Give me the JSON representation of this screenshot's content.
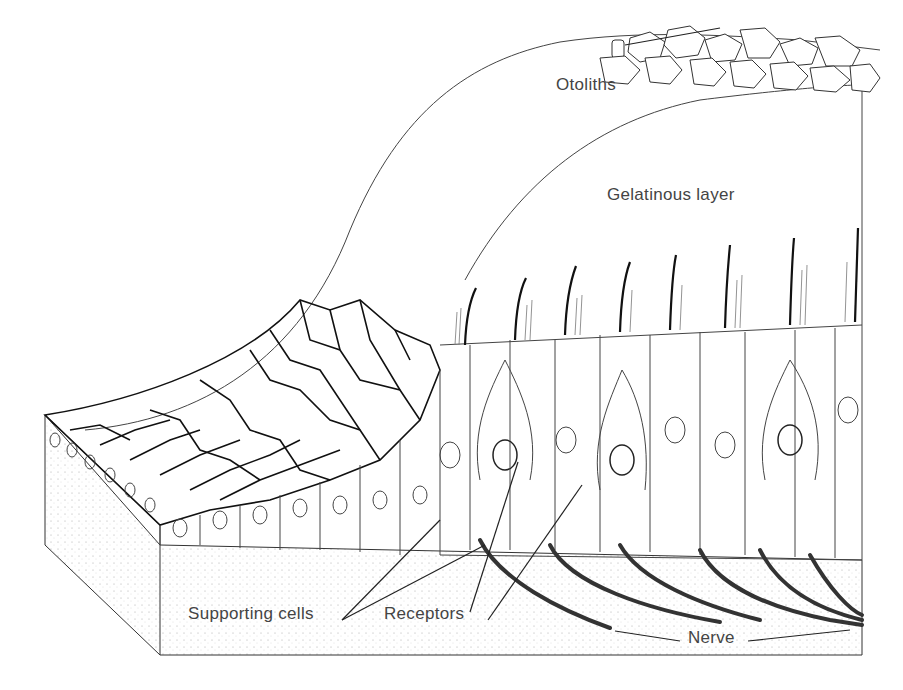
{
  "figure": {
    "labels": {
      "otoliths": "Otoliths",
      "gelatinous_layer": "Gelatinous layer",
      "supporting_cells": "Supporting cells",
      "receptors": "Receptors",
      "nerve": "Nerve"
    },
    "colors": {
      "ink": "#222222",
      "label_text": "#444444",
      "background": "#ffffff"
    }
  }
}
